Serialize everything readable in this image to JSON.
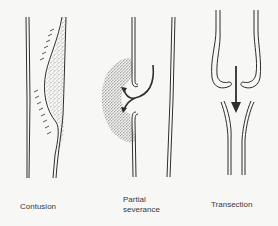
{
  "figure": {
    "panels": [
      {
        "id": "contusion",
        "label": "Contusion"
      },
      {
        "id": "partial",
        "label_line1": "Partial",
        "label_line2": "severance"
      },
      {
        "id": "transection",
        "label": "Transection"
      }
    ]
  },
  "colors": {
    "background": "#f7f7f5",
    "ink": "#2e2e2e",
    "text": "#3a3a3a"
  }
}
